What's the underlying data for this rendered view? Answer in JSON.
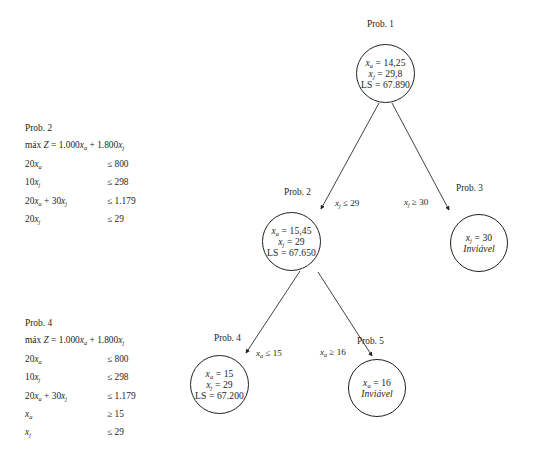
{
  "figure": {
    "type": "branch-and-bound-tree",
    "language": "pt-BR"
  },
  "nodes": [
    {
      "id": "n1",
      "caption": "Prob. 1",
      "lines": [
        "x",
        " = 14,25",
        "x",
        " = 29,8",
        "LS = 67.890"
      ],
      "line1_var": "x",
      "line1_sub": "a",
      "line1_rest": " = 14,25",
      "line2_var": "x",
      "line2_sub": "j",
      "line2_rest": " = 29,8",
      "line3": "LS = 67.890",
      "line3_italic": false
    },
    {
      "id": "n2",
      "caption": "Prob. 2",
      "line1_var": "x",
      "line1_sub": "a",
      "line1_rest": " = 15,45",
      "line2_var": "x",
      "line2_sub": "j",
      "line2_rest": " = 29",
      "line3": "LS = 67.650",
      "line3_italic": false
    },
    {
      "id": "n3",
      "caption": "Prob. 3",
      "line1_var": "x",
      "line1_sub": "j",
      "line1_rest": " = 30",
      "line2": "Inviável",
      "line2_italic": true
    },
    {
      "id": "n4",
      "caption": "Prob. 4",
      "line1_var": "x",
      "line1_sub": "a",
      "line1_rest": " = 15",
      "line2_var": "x",
      "line2_sub": "j",
      "line2_rest": " = 29",
      "line3": "LS = 67.200",
      "line3_italic": false
    },
    {
      "id": "n5",
      "caption": "Prob. 5",
      "line1_var": "x",
      "line1_sub": "a",
      "line1_rest": " = 16",
      "line2": "Inviável",
      "line2_italic": true
    }
  ],
  "edges": [
    {
      "id": "e1",
      "from": "n1",
      "to": "n2",
      "var": "x",
      "sub": "j",
      "rest": " ≤ 29"
    },
    {
      "id": "e2",
      "from": "n1",
      "to": "n3",
      "var": "x",
      "sub": "j",
      "rest": " ≥ 30"
    },
    {
      "id": "e3",
      "from": "n2",
      "to": "n4",
      "var": "x",
      "sub": "a",
      "rest": " ≤ 15"
    },
    {
      "id": "e4",
      "from": "n2",
      "to": "n5",
      "var": "x",
      "sub": "a",
      "rest": " ≥ 16"
    }
  ],
  "models": [
    {
      "id": "model2",
      "title": "Prob. 2",
      "objective_prefix": "máx ",
      "objective_z": "Z",
      "objective_body": " = 1.000",
      "objective_var1": "x",
      "objective_sub1": "a",
      "objective_plus": " + 1.800",
      "objective_var2": "x",
      "objective_sub2": "j",
      "constraints": [
        {
          "lhs_pre": "20",
          "lhs_var": "x",
          "lhs_sub": "a",
          "lhs_post": "",
          "rhs": "≤ 800"
        },
        {
          "lhs_pre": "10",
          "lhs_var": "x",
          "lhs_sub": "j",
          "lhs_post": "",
          "rhs": "≤ 298"
        },
        {
          "lhs_pre": "20",
          "lhs_var": "x",
          "lhs_sub": "a",
          "lhs_post": " + 30",
          "lhs_var2": "x",
          "lhs_sub2": "j",
          "rhs": "≤ 1.179"
        },
        {
          "lhs_pre": "20",
          "lhs_var": "x",
          "lhs_sub": "j",
          "lhs_post": "",
          "rhs": "≤ 29"
        }
      ]
    },
    {
      "id": "model4",
      "title": "Prob. 4",
      "objective_prefix": "máx ",
      "objective_z": "Z",
      "objective_body": " = 1.000",
      "objective_var1": "x",
      "objective_sub1": "a",
      "objective_plus": " + 1.800",
      "objective_var2": "x",
      "objective_sub2": "j",
      "constraints": [
        {
          "lhs_pre": "20",
          "lhs_var": "x",
          "lhs_sub": "a",
          "lhs_post": "",
          "rhs": "≤ 800"
        },
        {
          "lhs_pre": "10",
          "lhs_var": "x",
          "lhs_sub": "j",
          "lhs_post": "",
          "rhs": "≤ 298"
        },
        {
          "lhs_pre": "20",
          "lhs_var": "x",
          "lhs_sub": "a",
          "lhs_post": " + 30",
          "lhs_var2": "x",
          "lhs_sub2": "j",
          "rhs": "≤ 1.179"
        },
        {
          "lhs_pre": "",
          "lhs_var": "x",
          "lhs_sub": "a",
          "lhs_post": "",
          "rhs": "≥ 15"
        },
        {
          "lhs_pre": "",
          "lhs_var": "x",
          "lhs_sub": "j",
          "lhs_post": "",
          "rhs": "≤ 29"
        }
      ]
    }
  ],
  "colors": {
    "stroke": "#231f20",
    "background": "#ffffff"
  }
}
